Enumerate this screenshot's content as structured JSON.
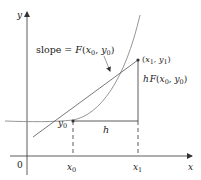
{
  "diagram": {
    "colors": {
      "axis": "#333333",
      "curve": "#8a8a8a",
      "tangent": "#555555",
      "text": "#222222"
    },
    "axes": {
      "x_label": "x",
      "y_label": "y",
      "origin_label": "0"
    },
    "ticks": {
      "x0_label": "x",
      "x0_sub": "0",
      "x1_label": "x",
      "x1_sub": "1"
    },
    "labels": {
      "slope_prefix": "slope = ",
      "slope_F": "F",
      "slope_args_open": "(",
      "slope_x": "x",
      "slope_x_sub": "0",
      "slope_comma": ", ",
      "slope_y": "y",
      "slope_y_sub": "0",
      "slope_args_close": ")",
      "point_open": "(",
      "point_x": "x",
      "point_x_sub": "1",
      "point_comma": ", ",
      "point_y": "y",
      "point_y_sub": "1",
      "point_close": ")",
      "step_h": "h",
      "rise_h": "h",
      "rise_F": "F",
      "rise_open": "(",
      "rise_x": "x",
      "rise_x_sub": "0",
      "rise_comma": ", ",
      "rise_y": "y",
      "rise_y_sub": "0",
      "rise_close": ")",
      "y0_label": "y",
      "y0_sub": "0"
    }
  }
}
